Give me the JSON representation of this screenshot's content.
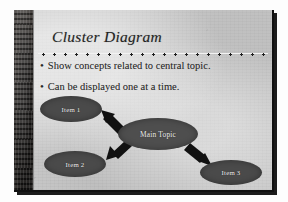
{
  "slide": {
    "title": "Cluster Diagram",
    "bullet_marker": "•",
    "bullets": [
      "Show concepts related to central topic.",
      "Can be displayed one at a time."
    ],
    "diagram": {
      "type": "cluster",
      "center": {
        "label": "Main Topic"
      },
      "nodes": [
        {
          "label": "Item 1"
        },
        {
          "label": "Item 2"
        },
        {
          "label": "Item 3"
        }
      ],
      "connectors": [
        {
          "from": "Main Topic",
          "to": "Item 1",
          "style": "block-arrow",
          "direction": "up-left"
        },
        {
          "from": "Main Topic",
          "to": "Item 2",
          "style": "block-arrow",
          "direction": "down-left"
        },
        {
          "from": "Main Topic",
          "to": "Item 3",
          "style": "block-arrow",
          "direction": "down-right"
        }
      ]
    },
    "colors": {
      "background": "#c9c9c9",
      "left_band": "#3a3633",
      "node_fill": "#4a4a4a",
      "node_text": "#f0f0f0",
      "body_text": "#2a2a2a",
      "arrow": "#111111"
    }
  }
}
